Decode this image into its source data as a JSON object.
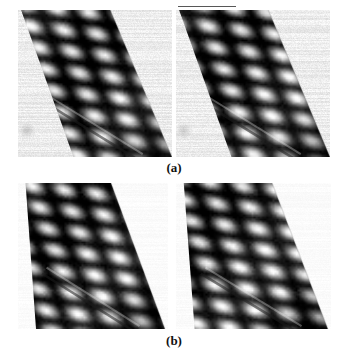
{
  "figure": {
    "kind": "microscopy-figure",
    "background_color": "#ffffff",
    "ink_color": "#111111",
    "panel_count": 4,
    "row_labels": [
      "(a)",
      "(b)"
    ]
  },
  "labels": {
    "a": "(a)",
    "b": "(b)"
  },
  "panels": [
    {
      "id": "panel-a-left",
      "row_label": "(a)",
      "position": "top-left",
      "x": 18,
      "y": 10,
      "width": 154,
      "height": 147,
      "band": {
        "orientation": "diagonal",
        "top_left_x_frac": 0.02,
        "top_right_x_frac": 0.6,
        "bottom_left_x_frac": 0.36,
        "bottom_right_x_frac": 1.0,
        "corner_cut": "top-left-and-bottom-left"
      },
      "lattice": {
        "type": "rhombic",
        "bright_blob_color": "#f2f2f2",
        "dark_line_color": "#1a1a1a",
        "mid_tone_color": "#8a8a8a",
        "row_count": 7,
        "column_count": 5,
        "angle_deg": 30
      },
      "background_texture": {
        "color": "#ececec",
        "streak_color": "#c9c9c9",
        "streak_direction": "horizontal",
        "noise_level": "medium"
      },
      "features": {
        "diagonal_step_line": true,
        "faint_round_spot": true,
        "faint_round_spot_x_frac": 0.06,
        "faint_round_spot_y_frac": 0.82
      }
    },
    {
      "id": "panel-a-right",
      "row_label": "(a)",
      "position": "top-right",
      "x": 176,
      "y": 10,
      "width": 154,
      "height": 147,
      "band": {
        "orientation": "diagonal",
        "top_left_x_frac": 0.02,
        "top_right_x_frac": 0.6,
        "bottom_left_x_frac": 0.36,
        "bottom_right_x_frac": 1.0,
        "corner_cut": "top-left-and-bottom-left"
      },
      "lattice": {
        "type": "rhombic",
        "bright_blob_color": "#f2f2f2",
        "dark_line_color": "#1a1a1a",
        "mid_tone_color": "#8a8a8a",
        "row_count": 7,
        "column_count": 5,
        "angle_deg": 30
      },
      "background_texture": {
        "color": "#ececec",
        "streak_color": "#c9c9c9",
        "streak_direction": "horizontal",
        "noise_level": "medium"
      },
      "features": {
        "diagonal_step_line": true,
        "faint_round_spot": true,
        "faint_round_spot_x_frac": 0.05,
        "faint_round_spot_y_frac": 0.82
      }
    },
    {
      "id": "panel-b-left",
      "row_label": "(b)",
      "position": "bottom-left",
      "x": 18,
      "y": 183,
      "width": 150,
      "height": 146,
      "band": {
        "orientation": "diagonal",
        "top_left_x_frac": 0.05,
        "top_right_x_frac": 0.62,
        "bottom_left_x_frac": 0.12,
        "bottom_right_x_frac": 0.98,
        "corner_cut": "top-left-and-bottom-left"
      },
      "lattice": {
        "type": "rhombic",
        "bright_blob_color": "#f5f5f5",
        "dark_line_color": "#1a1a1a",
        "mid_tone_color": "#8a8a8a",
        "row_count": 7,
        "column_count": 5,
        "angle_deg": 30
      },
      "background_texture": {
        "color": "#fbfbfb",
        "streak_color": "#f0f0f0",
        "streak_direction": "horizontal",
        "noise_level": "very-low"
      },
      "features": {
        "diagonal_step_line": true,
        "faint_round_spot": false
      }
    },
    {
      "id": "panel-b-right",
      "row_label": "(b)",
      "position": "bottom-right",
      "x": 176,
      "y": 183,
      "width": 155,
      "height": 146,
      "band": {
        "orientation": "diagonal",
        "top_left_x_frac": 0.05,
        "top_right_x_frac": 0.62,
        "bottom_left_x_frac": 0.12,
        "bottom_right_x_frac": 0.98,
        "corner_cut": "top-left-and-bottom-left"
      },
      "lattice": {
        "type": "rhombic",
        "bright_blob_color": "#f5f5f5",
        "dark_line_color": "#1a1a1a",
        "mid_tone_color": "#8a8a8a",
        "row_count": 7,
        "column_count": 5,
        "angle_deg": 30
      },
      "background_texture": {
        "color": "#fbfbfb",
        "streak_color": "#f0f0f0",
        "streak_direction": "horizontal",
        "noise_level": "very-low"
      },
      "features": {
        "diagonal_step_line": true,
        "faint_round_spot": false
      }
    }
  ],
  "artifacts": {
    "top_rule": {
      "x": 178,
      "y": 6,
      "width": 58,
      "height": 1,
      "color": "#3a3a3a"
    }
  }
}
